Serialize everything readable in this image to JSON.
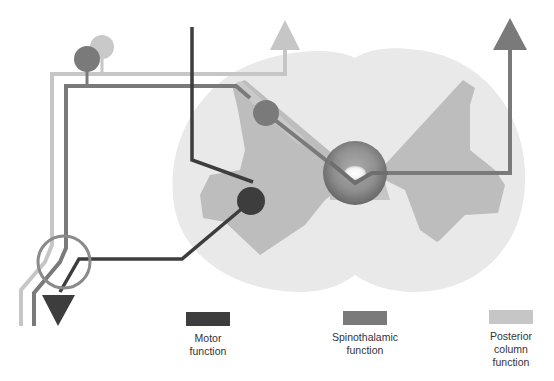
{
  "figure": {
    "type": "spinal-cord-pathways-schematic",
    "colors": {
      "motor": "#3d3d3d",
      "spinothalamic": "#7a7a7a",
      "posterior_column": "#c6c6c6",
      "cord_white_matter": "#e9e9e9",
      "cord_grey_matter": "#bdbdbd",
      "central_canal": "#6a6a6a"
    }
  },
  "legend": {
    "items": [
      {
        "key": "motor",
        "line1": "Motor",
        "line2": "function",
        "line3": "",
        "color": "#3d3d3d"
      },
      {
        "key": "spinothalamic",
        "line1": "Spinothalamic",
        "line2": "function",
        "line3": "",
        "color": "#7a7a7a"
      },
      {
        "key": "posterior_column",
        "line1": "Posterior",
        "line2": "column",
        "line3": "function",
        "color": "#c6c6c6"
      }
    ]
  }
}
